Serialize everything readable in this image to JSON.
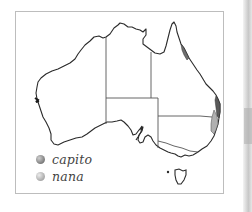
{
  "map": {
    "title": "Distribution map of Australia",
    "region": "Australia",
    "outline_color": "#2a2a2a",
    "border_color": "#555555"
  },
  "legend": {
    "items": [
      {
        "label": "capito",
        "color": "#7a7a7a",
        "icon": "circle-dot-icon"
      },
      {
        "label": "nana",
        "color": "#b2b2b2",
        "icon": "circle-dot-icon"
      }
    ]
  },
  "ranges": [
    {
      "species": "capito",
      "area": "north-east Queensland coast",
      "color": "#6e6e6e"
    },
    {
      "species": "capito",
      "area": "south-east Queensland coast",
      "color": "#5a5a5a"
    },
    {
      "species": "nana",
      "area": "northern New South Wales coast",
      "color": "#b0b0b0"
    }
  ]
}
